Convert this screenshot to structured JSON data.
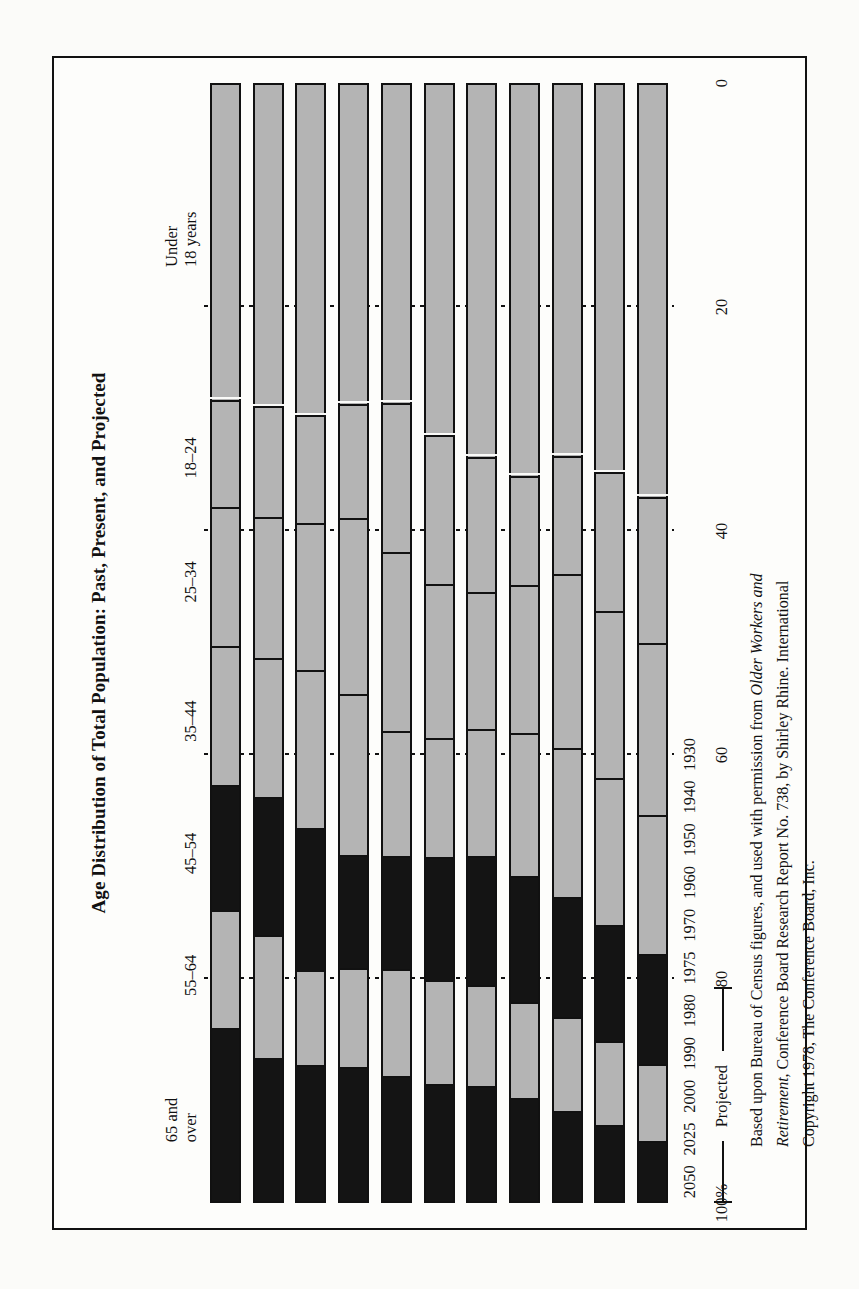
{
  "figure": {
    "title": "Age Distribution of Total Population: Past, Present, and Projected",
    "projected_label": "Projected",
    "caption_line1": "Based upon Bureau of Census figures, and used with permission from ",
    "caption_italic1": "Older Workers and",
    "caption_italic2": "Retirement",
    "caption_line2": ", Conference Board Research Report No. 738, by Shirley Rhine. International",
    "caption_line3": "Copyright 1978, The Conference Board, Inc."
  },
  "chart_data": {
    "type": "bar",
    "title": "Age Distribution of Total Population: Past, Present, and Projected",
    "orientation": "horizontal-stacked",
    "stacked": true,
    "normalized_percent": true,
    "xlabel": "",
    "ylabel": "",
    "xlim": [
      0,
      100
    ],
    "grid": false,
    "legend_position": "top",
    "axis_tick_labels": [
      "100%",
      "80",
      "60",
      "40",
      "20",
      "0"
    ],
    "axis_tick_values": [
      100,
      80,
      60,
      40,
      20,
      0
    ],
    "categories": [
      "1930",
      "1940",
      "1950",
      "1960",
      "1970",
      "1975",
      "1980",
      "1990",
      "2000",
      "2025",
      "2050"
    ],
    "historical_categories": [
      "1930",
      "1940",
      "1950",
      "1960",
      "1970",
      "1975"
    ],
    "projected_categories": [
      "1980",
      "1990",
      "2000",
      "2025",
      "2050"
    ],
    "series": [
      {
        "name": "65 and over",
        "shade": "dark",
        "values": [
          5.4,
          6.8,
          8.1,
          9.2,
          10.3,
          10.5,
          11.2,
          12.0,
          12.2,
          12.8,
          15.5
        ]
      },
      {
        "name": "55–64",
        "shade": "light",
        "values": [
          6.9,
          7.5,
          8.4,
          8.6,
          9.1,
          9.3,
          9.6,
          8.9,
          8.5,
          11.0,
          10.6
        ]
      },
      {
        "name": "45–54",
        "shade": "dark",
        "values": [
          9.8,
          10.4,
          10.7,
          11.3,
          11.5,
          11.0,
          10.1,
          10.1,
          12.7,
          12.4,
          11.2
        ]
      },
      {
        "name": "35–44",
        "shade": "light",
        "values": [
          12.5,
          13.2,
          13.4,
          12.8,
          11.4,
          10.7,
          11.2,
          14.4,
          14.2,
          12.5,
          12.4
        ]
      },
      {
        "name": "25–34",
        "shade": "light",
        "values": [
          15.4,
          15.0,
          15.6,
          13.3,
          12.3,
          13.8,
          16.1,
          15.8,
          13.2,
          12.6,
          12.5
        ]
      },
      {
        "name": "18–24",
        "shade": "light",
        "values": [
          13.1,
          12.4,
          10.6,
          9.8,
          12.1,
          13.3,
          13.3,
          10.2,
          9.6,
          9.9,
          9.6
        ]
      },
      {
        "name": "Under 18 years",
        "shade": "light",
        "values": [
          36.9,
          34.7,
          33.2,
          35.0,
          33.3,
          31.4,
          28.5,
          28.6,
          29.6,
          28.8,
          28.2
        ]
      }
    ],
    "legend_entries": [
      "65 and\nover",
      "55–64",
      "45–54",
      "35–44",
      "25–34",
      "18–24",
      "Under\n18 years"
    ],
    "annotations": [
      "Projected bracket spans 1980–2050"
    ]
  }
}
